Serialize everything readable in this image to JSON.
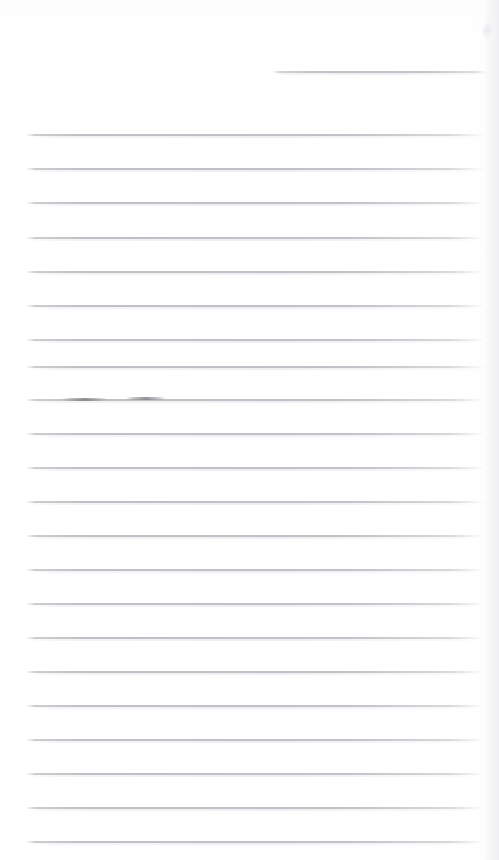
{
  "document": {
    "kind": "scanned-ruled-page",
    "title": "Blank ruled notebook page",
    "width": 499,
    "height": 860,
    "background_color": "#ffffff",
    "rule_color": "#bcbcc2",
    "rule_shadow_color": "#eeeef2",
    "ink_mark_color": "#787880",
    "body_text": "",
    "visible_text": []
  },
  "header_rule": {
    "label": "header rule",
    "x": 272,
    "y": 71,
    "width": 215
  },
  "rules": [
    {
      "label": "ruled line 1",
      "x": 26,
      "y": 134,
      "width": 459
    },
    {
      "label": "ruled line 2",
      "x": 26,
      "y": 168,
      "width": 459
    },
    {
      "label": "ruled line 3",
      "x": 26,
      "y": 202,
      "width": 459
    },
    {
      "label": "ruled line 4",
      "x": 26,
      "y": 237,
      "width": 459
    },
    {
      "label": "ruled line 5",
      "x": 26,
      "y": 271,
      "width": 459
    },
    {
      "label": "ruled line 6",
      "x": 26,
      "y": 305,
      "width": 459
    },
    {
      "label": "ruled line 7",
      "x": 26,
      "y": 339,
      "width": 459
    },
    {
      "label": "ruled line 8",
      "x": 26,
      "y": 366,
      "width": 459
    },
    {
      "label": "ruled line 9",
      "x": 26,
      "y": 399,
      "width": 459
    },
    {
      "label": "ruled line 10",
      "x": 26,
      "y": 433,
      "width": 459
    },
    {
      "label": "ruled line 11",
      "x": 26,
      "y": 467,
      "width": 459
    },
    {
      "label": "ruled line 12",
      "x": 26,
      "y": 501,
      "width": 459
    },
    {
      "label": "ruled line 13",
      "x": 26,
      "y": 535,
      "width": 459
    },
    {
      "label": "ruled line 14",
      "x": 26,
      "y": 569,
      "width": 459
    },
    {
      "label": "ruled line 15",
      "x": 26,
      "y": 603,
      "width": 459
    },
    {
      "label": "ruled line 16",
      "x": 26,
      "y": 637,
      "width": 459
    },
    {
      "label": "ruled line 17",
      "x": 26,
      "y": 671,
      "width": 459
    },
    {
      "label": "ruled line 18",
      "x": 26,
      "y": 705,
      "width": 459
    },
    {
      "label": "ruled line 19",
      "x": 26,
      "y": 739,
      "width": 459
    },
    {
      "label": "ruled line 20",
      "x": 26,
      "y": 773,
      "width": 459
    },
    {
      "label": "ruled line 21",
      "x": 26,
      "y": 807,
      "width": 459
    },
    {
      "label": "ruled line 22",
      "x": 26,
      "y": 841,
      "width": 459
    }
  ],
  "ink_marks": [
    {
      "label": "ink mark left",
      "x": 62,
      "y": 398,
      "width": 46
    },
    {
      "label": "ink mark right",
      "x": 126,
      "y": 397,
      "width": 40
    }
  ]
}
